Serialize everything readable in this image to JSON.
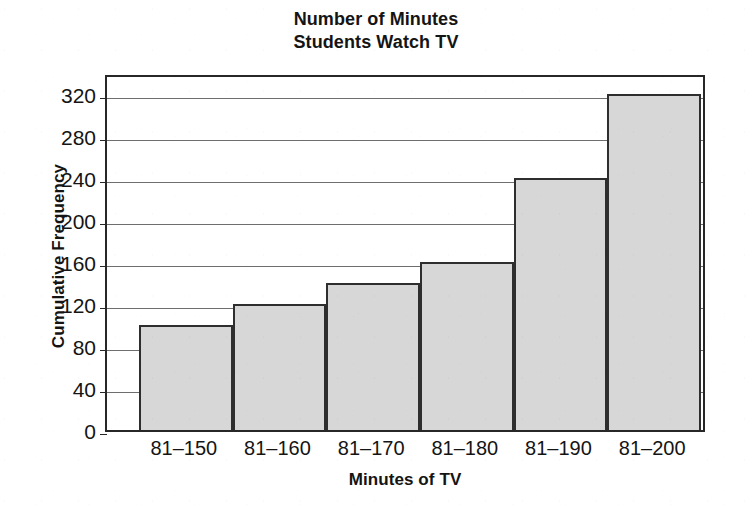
{
  "chart_data": {
    "type": "bar",
    "title": "Number of Minutes Students Watch TV",
    "title_lines": [
      "Number of Minutes",
      "Students Watch TV"
    ],
    "xlabel": "Minutes of TV",
    "ylabel": "Cumulative Frequency",
    "categories": [
      "81–150",
      "81–160",
      "81–170",
      "81–180",
      "81–190",
      "81–200"
    ],
    "values": [
      100,
      120,
      140,
      160,
      240,
      320
    ],
    "ylim": [
      0,
      340
    ],
    "yticks": [
      0,
      40,
      80,
      120,
      160,
      200,
      240,
      280,
      320
    ],
    "ytick_labels": [
      "0",
      "40",
      "80",
      "120",
      "160",
      "200",
      "240",
      "280",
      "320"
    ],
    "grid": true,
    "legend": "none",
    "bar_fill_color": "#d7d7d7",
    "bar_border_color": "#2e2e2e",
    "gridline_color": "#6e6e6e",
    "axis_color": "#272727",
    "background_color": "#ffffff",
    "text_color": "#141414"
  }
}
